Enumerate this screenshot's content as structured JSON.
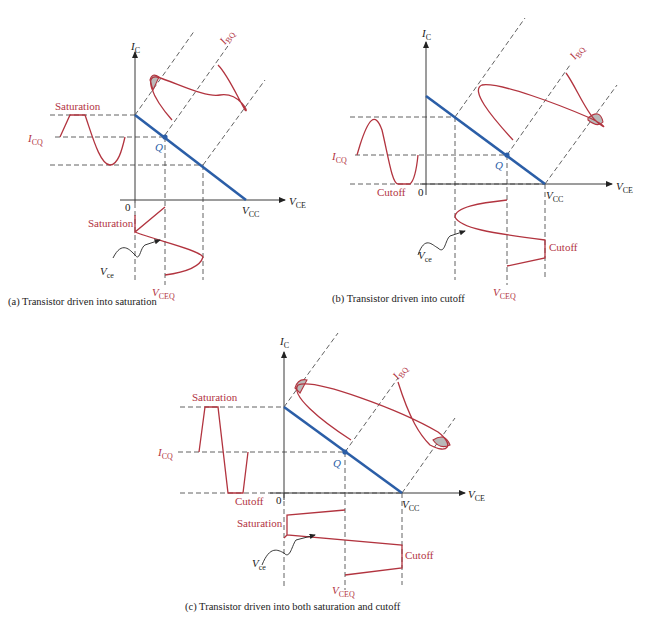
{
  "colors": {
    "waveform": "#b2343f",
    "load_line": "#2b5ea7",
    "axes": "#3a3a3a",
    "clip_shade": "#b9b9b9"
  },
  "panels": [
    {
      "id": "a",
      "caption": "(a) Transistor driven into saturation",
      "y_axis": {
        "symbol": "I",
        "sub": "C"
      },
      "x_axis": {
        "symbol": "V",
        "sub": "CE"
      },
      "origin_label": "0",
      "vcc_label": {
        "symbol": "V",
        "sub": "CC"
      },
      "ibq_label": {
        "symbol": "I",
        "sub": "BQ"
      },
      "icq_label": {
        "symbol": "I",
        "sub": "CQ"
      },
      "vceq_label": {
        "symbol": "V",
        "sub": "CEQ"
      },
      "q_label": "Q",
      "vce_label": {
        "symbol": "V",
        "sub": "ce"
      },
      "clip_labels": [
        "Saturation",
        "Saturation"
      ]
    },
    {
      "id": "b",
      "caption": "(b) Transistor driven into cutoff",
      "y_axis": {
        "symbol": "I",
        "sub": "C"
      },
      "x_axis": {
        "symbol": "V",
        "sub": "CE"
      },
      "origin_label": "0",
      "vcc_label": {
        "symbol": "V",
        "sub": "CC"
      },
      "ibq_label": {
        "symbol": "I",
        "sub": "BQ"
      },
      "icq_label": {
        "symbol": "I",
        "sub": "CQ"
      },
      "vceq_label": {
        "symbol": "V",
        "sub": "CEQ"
      },
      "q_label": "Q",
      "vce_label": {
        "symbol": "V",
        "sub": "ce"
      },
      "clip_labels": [
        "Cutoff",
        "Cutoff"
      ]
    },
    {
      "id": "c",
      "caption": "(c) Transistor driven into both saturation and cutoff",
      "y_axis": {
        "symbol": "I",
        "sub": "C"
      },
      "x_axis": {
        "symbol": "V",
        "sub": "CE"
      },
      "origin_label": "0",
      "vcc_label": {
        "symbol": "V",
        "sub": "CC"
      },
      "ibq_label": {
        "symbol": "I",
        "sub": "BQ"
      },
      "icq_label": {
        "symbol": "I",
        "sub": "CQ"
      },
      "vceq_label": {
        "symbol": "V",
        "sub": "CEQ"
      },
      "q_label": "Q",
      "vce_label": {
        "symbol": "V",
        "sub": "ce"
      },
      "clip_labels": [
        "Saturation",
        "Cutoff",
        "Saturation",
        "Cutoff"
      ]
    }
  ]
}
